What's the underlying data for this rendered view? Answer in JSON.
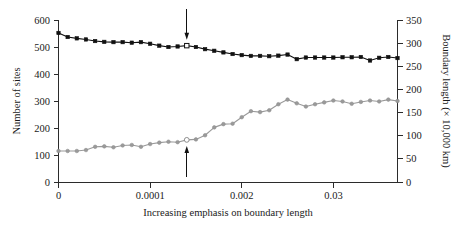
{
  "chart_data": {
    "type": "line",
    "title": "",
    "subtitle": "",
    "xlabel": "Increasing emphasis on boundary length",
    "ylabel": "Number of sites",
    "y2label": "Boundary length (× 10,000 km)",
    "grid": false,
    "legend_position": "none",
    "x_tick_labels": [
      "0",
      "0.0001",
      "0.002",
      "0.03"
    ],
    "x_tick_positions": [
      0,
      10,
      20,
      30
    ],
    "xlim": [
      0,
      37
    ],
    "y_tick_labels": [
      "0",
      "100",
      "200",
      "300",
      "400",
      "500",
      "600"
    ],
    "ylim": [
      0,
      600
    ],
    "y2_tick_labels": [
      "0",
      "50",
      "100",
      "150",
      "200",
      "250",
      "300",
      "350"
    ],
    "y2lim": [
      0,
      350
    ],
    "x": [
      0,
      1,
      2,
      3,
      4,
      5,
      6,
      7,
      8,
      9,
      10,
      11,
      12,
      13,
      14,
      15,
      16,
      17,
      18,
      19,
      20,
      21,
      22,
      23,
      24,
      25,
      26,
      27,
      28,
      29,
      30,
      31,
      32,
      33,
      34,
      35,
      36,
      37
    ],
    "series": [
      {
        "name": "Number of sites",
        "axis": "left",
        "color": "#111111",
        "marker": "filled-square",
        "highlight_index": 14,
        "highlight_marker": "open-square",
        "values": [
          552,
          537,
          532,
          528,
          522,
          519,
          518,
          518,
          516,
          518,
          512,
          505,
          500,
          502,
          505,
          500,
          492,
          486,
          480,
          474,
          470,
          467,
          467,
          466,
          468,
          472,
          455,
          461,
          461,
          461,
          461,
          462,
          462,
          463,
          450,
          460,
          463,
          459
        ]
      },
      {
        "name": "Boundary length",
        "axis": "right",
        "color": "#9a9a9a",
        "marker": "filled-circle",
        "highlight_index": 14,
        "highlight_marker": "open-circle",
        "values": [
          67,
          67,
          67,
          69,
          76,
          77,
          75,
          79,
          80,
          76,
          82,
          85,
          87,
          86,
          91,
          92,
          101,
          118,
          125,
          126,
          140,
          153,
          151,
          155,
          168,
          178,
          170,
          163,
          168,
          172,
          176,
          174,
          169,
          173,
          176,
          174,
          178,
          175
        ]
      }
    ],
    "annotations": [
      {
        "name": "upper-arrow",
        "direction": "down",
        "target_series": "Number of sites",
        "target_index": 14,
        "target_value": 505
      },
      {
        "name": "lower-arrow",
        "direction": "up",
        "target_series": "Boundary length",
        "target_index": 14,
        "target_value": 91
      }
    ]
  },
  "axes": {
    "left_title": "Number of sites",
    "right_title": "Boundary length (× 10,000 km)",
    "bottom_title": "Increasing emphasis on boundary length"
  },
  "colors": {
    "black_series": "#111111",
    "gray_series": "#9a9a9a",
    "axis": "#2b2b2b",
    "background": "#ffffff"
  }
}
